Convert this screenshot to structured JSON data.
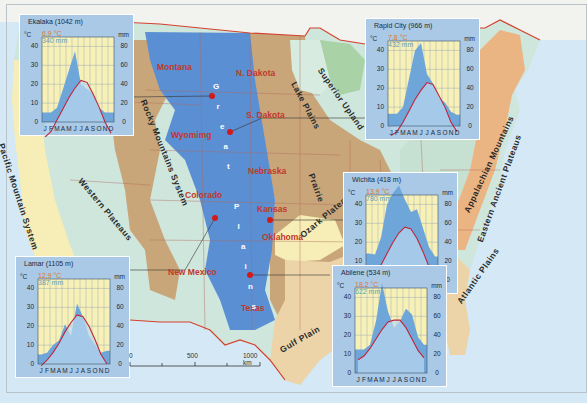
{
  "map": {
    "states": [
      {
        "name": "Montana",
        "x": 157,
        "y": 62
      },
      {
        "name": "N. Dakota",
        "x": 236,
        "y": 68
      },
      {
        "name": "S. Dakota",
        "x": 246,
        "y": 110
      },
      {
        "name": "Wyomimg",
        "x": 171,
        "y": 130
      },
      {
        "name": "Nebraska",
        "x": 248,
        "y": 166
      },
      {
        "name": "Colorado",
        "x": 185,
        "y": 190
      },
      {
        "name": "Kansas",
        "x": 257,
        "y": 204
      },
      {
        "name": "Oklahoma",
        "x": 262,
        "y": 232
      },
      {
        "name": "New Mexico",
        "x": 168,
        "y": 267
      },
      {
        "name": "Texas",
        "x": 241,
        "y": 303
      }
    ],
    "regions": [
      {
        "name": "Lake Plains",
        "x": 298,
        "y": 80,
        "rot": 62
      },
      {
        "name": "Superior Upland",
        "x": 324,
        "y": 66,
        "rot": 55
      },
      {
        "name": "Prairie",
        "x": 316,
        "y": 172,
        "rot": 70
      },
      {
        "name": "Ozark Plateaus",
        "x": 298,
        "y": 232,
        "rot": -40
      },
      {
        "name": "Gulf Plain",
        "x": 278,
        "y": 346,
        "rot": -30
      },
      {
        "name": "Pacific Mountain System",
        "x": 6,
        "y": 142,
        "rot": 72
      },
      {
        "name": "Western Plateaus",
        "x": 84,
        "y": 176,
        "rot": 50
      },
      {
        "name": "Rocky Mountains System",
        "x": 148,
        "y": 98,
        "rot": 68
      },
      {
        "name": "Appalachian Mountains",
        "x": 462,
        "y": 210,
        "rot": -65
      },
      {
        "name": "Eastern Ancient Plateaus",
        "x": 475,
        "y": 240,
        "rot": -70
      },
      {
        "name": "Atlantic Plains",
        "x": 455,
        "y": 300,
        "rot": -55
      }
    ],
    "great_plains_label": [
      "G",
      "r",
      "e",
      "a",
      "t",
      "",
      "P",
      "l",
      "a",
      "i",
      "n",
      "s"
    ],
    "scale_bar": {
      "ticks": [
        "0",
        "500",
        "1000 km"
      ]
    },
    "colors": {
      "ocean": "#d4e9f5",
      "great_plains": "#5b8fd4",
      "rocky_mountains": "#c9a67a",
      "plateaus": "#cfe6dc",
      "pacific": "#f6eeb6",
      "interior": "#c9a67a",
      "appalachian": "#c6e0d2",
      "eastern": "#ebb583",
      "coastal": "#ecd4a8",
      "lake_plains": "#d8ebe0",
      "superior": "#a9d3a6",
      "ozark": "#f6eeb6",
      "canada": "#f2f2ef",
      "border": "#d4412d",
      "station": "#d11a1a"
    }
  },
  "chart_data": [
    {
      "type": "line",
      "title": "Ekalaka (1042 m)",
      "station": "Ekalaka",
      "elevation": "1042 m",
      "mean_temp": "6,9 °C",
      "annual_precip": "340 mm",
      "categories": [
        "J",
        "F",
        "M",
        "A",
        "M",
        "J",
        "J",
        "A",
        "S",
        "O",
        "N",
        "D"
      ],
      "series": [
        {
          "name": "Temperature (°C)",
          "values": [
            -8,
            -5,
            1,
            7,
            13,
            18,
            22,
            21,
            15,
            8,
            0,
            -6
          ]
        },
        {
          "name": "Precipitation (mm)",
          "values": [
            10,
            10,
            15,
            35,
            55,
            75,
            40,
            35,
            30,
            15,
            10,
            10
          ]
        }
      ],
      "ylabel_left": "°C",
      "ylabel_right": "mm",
      "yticks_left": [
        0,
        10,
        20,
        30,
        40
      ],
      "yticks_right": [
        0,
        20,
        40,
        60,
        80
      ],
      "ylim_left": [
        0,
        45
      ],
      "ylim_right": [
        0,
        90
      ]
    },
    {
      "type": "line",
      "title": "Rapid City (966 m)",
      "station": "Rapid City",
      "elevation": "966 m",
      "mean_temp": "7,8 °C",
      "annual_precip": "432 mm",
      "categories": [
        "J",
        "F",
        "M",
        "A",
        "M",
        "J",
        "J",
        "A",
        "S",
        "O",
        "N",
        "D"
      ],
      "series": [
        {
          "name": "Temperature (°C)",
          "values": [
            -5,
            -3,
            2,
            8,
            14,
            19,
            23,
            22,
            16,
            10,
            2,
            -3
          ]
        },
        {
          "name": "Precipitation (mm)",
          "values": [
            13,
            13,
            20,
            50,
            80,
            88,
            55,
            45,
            30,
            25,
            15,
            12
          ]
        }
      ],
      "ylabel_left": "°C",
      "ylabel_right": "mm",
      "yticks_left": [
        0,
        10,
        20,
        30,
        40
      ],
      "yticks_right": [
        0,
        20,
        40,
        60,
        80
      ],
      "ylim_left": [
        0,
        45
      ],
      "ylim_right": [
        0,
        90
      ]
    },
    {
      "type": "line",
      "title": "Wichita (418 m)",
      "station": "Wichita",
      "elevation": "418 m",
      "mean_temp": "13,9 °C",
      "annual_precip": "780 mm",
      "categories": [
        "J",
        "F",
        "M",
        "A",
        "M",
        "J",
        "J",
        "A",
        "S",
        "O",
        "N",
        "D"
      ],
      "series": [
        {
          "name": "Temperature (°C)",
          "values": [
            0,
            3,
            8,
            14,
            20,
            25,
            28,
            27,
            22,
            15,
            7,
            2
          ]
        },
        {
          "name": "Precipitation (mm)",
          "values": [
            28,
            27,
            45,
            80,
            92,
            100,
            85,
            72,
            75,
            55,
            35,
            25
          ]
        }
      ],
      "ylabel_left": "°C",
      "ylabel_right": "mm",
      "yticks_left": [
        0,
        10,
        20,
        30,
        40
      ],
      "yticks_right": [
        0,
        20,
        40,
        60,
        80
      ],
      "ylim_left": [
        0,
        45
      ],
      "ylim_right": [
        0,
        90
      ]
    },
    {
      "type": "line",
      "title": "Lamar (1105 m)",
      "station": "Lamar",
      "elevation": "1105 m",
      "mean_temp": "12,9 °C",
      "annual_precip": "387 mm",
      "categories": [
        "J",
        "F",
        "M",
        "A",
        "M",
        "J",
        "J",
        "A",
        "S",
        "O",
        "N",
        "D"
      ],
      "series": [
        {
          "name": "Temperature (°C)",
          "values": [
            -1,
            2,
            6,
            11,
            17,
            22,
            26,
            25,
            20,
            13,
            5,
            0
          ]
        },
        {
          "name": "Precipitation (mm)",
          "values": [
            10,
            12,
            20,
            25,
            42,
            30,
            64,
            50,
            30,
            20,
            12,
            14
          ]
        }
      ],
      "ylabel_left": "°C",
      "ylabel_right": "mm",
      "yticks_left": [
        0,
        10,
        20,
        30,
        40
      ],
      "yticks_right": [
        0,
        20,
        40,
        60,
        80
      ],
      "ylim_left": [
        0,
        45
      ],
      "ylim_right": [
        0,
        90
      ]
    },
    {
      "type": "line",
      "title": "Abilene (534 m)",
      "station": "Abilene",
      "elevation": "534 m",
      "mean_temp": "18,2 °C",
      "annual_precip": "622 mm",
      "categories": [
        "J",
        "F",
        "M",
        "A",
        "M",
        "J",
        "J",
        "A",
        "S",
        "O",
        "N",
        "D"
      ],
      "series": [
        {
          "name": "Temperature (°C)",
          "values": [
            7,
            9,
            13,
            18,
            23,
            27,
            28,
            28,
            24,
            18,
            12,
            8
          ]
        },
        {
          "name": "Precipitation (mm)",
          "values": [
            25,
            25,
            30,
            55,
            95,
            65,
            48,
            55,
            68,
            62,
            38,
            30
          ]
        }
      ],
      "ylabel_left": "°C",
      "ylabel_right": "mm",
      "yticks_left": [
        0,
        10,
        20,
        30,
        40
      ],
      "yticks_right": [
        0,
        20,
        40,
        60,
        80
      ],
      "ylim_left": [
        0,
        45
      ],
      "ylim_right": [
        0,
        90
      ]
    }
  ]
}
